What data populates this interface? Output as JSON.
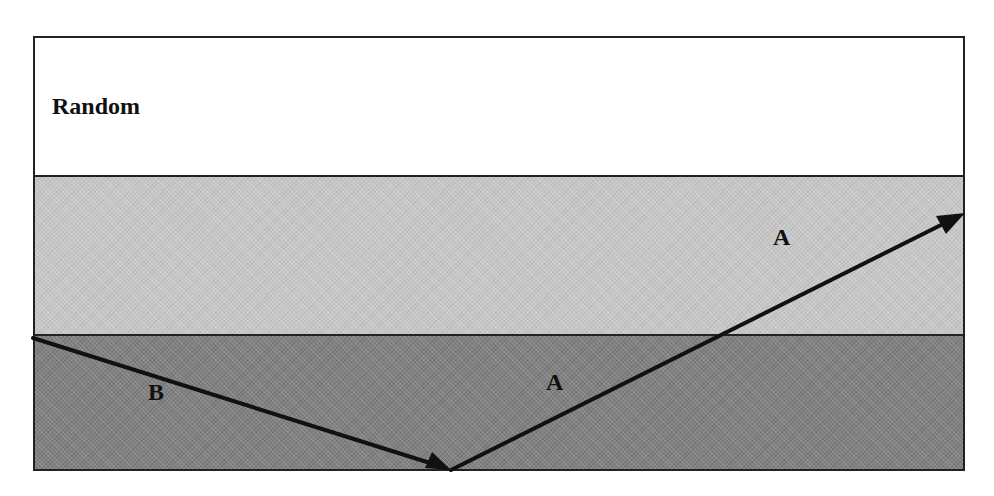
{
  "diagram": {
    "title_label": "Random",
    "layers": [
      {
        "name": "top",
        "fill": "#ffffff"
      },
      {
        "name": "middle",
        "fill": "#c6c6c6"
      },
      {
        "name": "bottom",
        "fill": "#818181"
      }
    ],
    "rays": [
      {
        "id": "ray-b",
        "label": "B",
        "from": [
          33,
          338
        ],
        "to": [
          451,
          470
        ]
      },
      {
        "id": "ray-a",
        "label": "A",
        "from": [
          451,
          470
        ],
        "to": [
          965,
          213
        ]
      }
    ],
    "labels": {
      "ray_b": "B",
      "ray_a_lower": "A",
      "ray_a_upper": "A"
    },
    "colors": {
      "outline": "#222222",
      "arrow": "#111111"
    }
  }
}
